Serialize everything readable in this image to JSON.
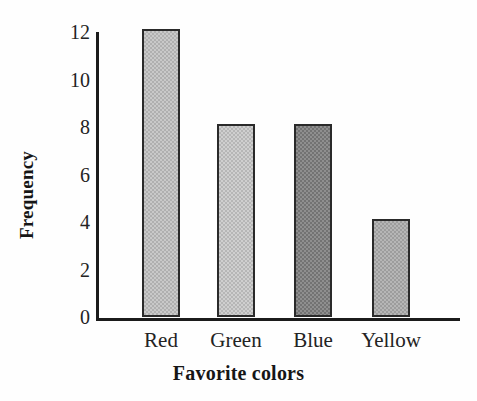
{
  "chart_data": {
    "type": "bar",
    "title": "",
    "subtitle": "",
    "categories": [
      "Red",
      "Green",
      "Blue",
      "Yellow"
    ],
    "values": [
      12,
      8,
      8,
      4
    ],
    "xlabel": "Favorite colors",
    "ylabel": "Frequency",
    "ylim": [
      0,
      12
    ],
    "yticks": [
      12,
      10,
      8,
      6,
      4,
      2,
      0
    ],
    "ytick_labels": [
      "12",
      "10",
      "8",
      "6",
      "4",
      "2",
      "0"
    ],
    "grid": false,
    "legend": null,
    "annotations": [],
    "bar_styles": [
      {
        "category": "Red",
        "fill": "#c9c9c9",
        "texture": "#b0b0b0",
        "border": "#2a2a2a"
      },
      {
        "category": "Green",
        "fill": "#cfcfcf",
        "texture": "#b6b6b6",
        "border": "#2a2a2a"
      },
      {
        "category": "Blue",
        "fill": "#8f8f8f",
        "texture": "#737373",
        "border": "#2a2a2a"
      },
      {
        "category": "Yellow",
        "fill": "#b6b6b6",
        "texture": "#9d9d9d",
        "border": "#2a2a2a"
      }
    ],
    "axis_color": "#1b1b1b",
    "background": "#fefefe"
  }
}
